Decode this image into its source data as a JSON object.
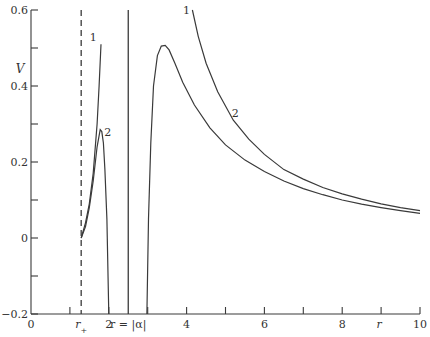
{
  "chart_data": {
    "type": "line",
    "title": "",
    "xlabel": "r",
    "ylabel": "V",
    "xlim": [
      0,
      10
    ],
    "ylim": [
      -0.2,
      0.6
    ],
    "grid": false,
    "legend": "none (curves labeled inline 1 and 2)",
    "x_ticks": [
      0,
      1,
      2,
      3,
      4,
      5,
      6,
      7,
      8,
      9,
      10
    ],
    "x_tick_labels": [
      {
        "value": 0,
        "label": "0"
      },
      {
        "value": 1.29,
        "label": "r+"
      },
      {
        "value": 2,
        "label": "2"
      },
      {
        "value": 2.5,
        "label": "r = |α|"
      },
      {
        "value": 4,
        "label": "4"
      },
      {
        "value": 6,
        "label": "6"
      },
      {
        "value": 8,
        "label": "8"
      },
      {
        "value": 8.95,
        "label": "r"
      },
      {
        "value": 10,
        "label": "10"
      }
    ],
    "y_ticks": [
      -0.2,
      -0.1,
      0,
      0.1,
      0.2,
      0.3,
      0.4,
      0.5,
      0.6
    ],
    "y_tick_labels": [
      {
        "value": -0.2,
        "label": "−0.2"
      },
      {
        "value": 0,
        "label": "0"
      },
      {
        "value": 0.2,
        "label": "0.2"
      },
      {
        "value": 0.4,
        "label": "0.4"
      },
      {
        "value": 0.6,
        "label": "0.6"
      }
    ],
    "vertical_lines": [
      {
        "x": 1.29,
        "style": "dashed",
        "label": "r+"
      },
      {
        "x": 2.5,
        "style": "solid",
        "label": "r = |α|"
      }
    ],
    "series": [
      {
        "name": "1",
        "segments": [
          {
            "x": [
              1.29,
              1.4,
              1.5,
              1.6,
              1.7,
              1.75,
              1.8
            ],
            "y": [
              0.0,
              0.04,
              0.09,
              0.17,
              0.3,
              0.4,
              0.51
            ]
          },
          {
            "x": [
              4.15,
              4.3,
              4.5,
              4.8,
              5.2,
              5.6,
              6.0,
              6.5,
              7.0,
              7.5,
              8.0,
              8.5,
              9.0,
              9.5,
              10.0
            ],
            "y": [
              0.6,
              0.53,
              0.46,
              0.385,
              0.31,
              0.26,
              0.22,
              0.18,
              0.155,
              0.133,
              0.116,
              0.102,
              0.09,
              0.08,
              0.072
            ]
          }
        ],
        "label_pos": {
          "x": 1.6,
          "y": 0.53
        }
      },
      {
        "name": "2",
        "segments": [
          {
            "x": [
              1.29,
              1.4,
              1.5,
              1.6,
              1.7,
              1.78,
              1.82,
              1.86,
              1.9,
              1.95,
              2.0
            ],
            "y": [
              0.0,
              0.03,
              0.08,
              0.15,
              0.24,
              0.285,
              0.28,
              0.25,
              0.18,
              0.05,
              -0.2
            ]
          },
          {
            "x": [
              2.98,
              3.02,
              3.08,
              3.15,
              3.25,
              3.35,
              3.45,
              3.55,
              3.7,
              3.9,
              4.2,
              4.6,
              5.0,
              5.5,
              6.0,
              6.5,
              7.0,
              7.5,
              8.0,
              8.5,
              9.0,
              9.5,
              10.0
            ],
            "y": [
              -0.2,
              0.05,
              0.25,
              0.4,
              0.48,
              0.505,
              0.507,
              0.495,
              0.46,
              0.41,
              0.35,
              0.29,
              0.245,
              0.205,
              0.175,
              0.15,
              0.13,
              0.114,
              0.1,
              0.089,
              0.08,
              0.072,
              0.065
            ]
          }
        ],
        "label_pos": {
          "x": 1.97,
          "y": 0.28
        }
      }
    ],
    "annotations": [
      {
        "text": "1",
        "x": 1.6,
        "y": 0.53
      },
      {
        "text": "2",
        "x": 1.97,
        "y": 0.28
      },
      {
        "text": "1",
        "x": 4.0,
        "y": 0.6
      },
      {
        "text": "2",
        "x": 5.25,
        "y": 0.33
      }
    ]
  }
}
